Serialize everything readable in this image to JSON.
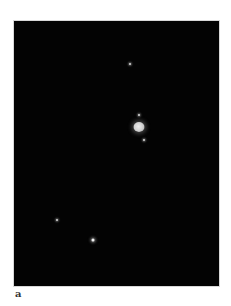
{
  "figure": {
    "panel_label": "a",
    "background_color": "#030303",
    "objects": [
      {
        "type": "star",
        "name": "star-top",
        "x": 130,
        "y": 64,
        "bright": false
      },
      {
        "type": "moon",
        "name": "moon-above-planet",
        "x": 139,
        "y": 115,
        "bright": false
      },
      {
        "type": "planet",
        "name": "planet",
        "x": 139,
        "y": 127
      },
      {
        "type": "moon",
        "name": "moon-below-planet",
        "x": 144,
        "y": 140,
        "bright": false
      },
      {
        "type": "star",
        "name": "star-lower-left",
        "x": 57,
        "y": 220,
        "bright": false
      },
      {
        "type": "star",
        "name": "star-bottom",
        "x": 93,
        "y": 240,
        "bright": true
      }
    ]
  }
}
